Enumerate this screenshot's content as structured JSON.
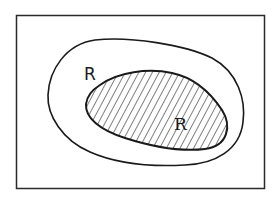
{
  "diagram": {
    "type": "venn-region",
    "frame": {
      "stroke": "#2a2a2a"
    },
    "outer_region": {
      "label": "R",
      "stroke": "#1a1a1a"
    },
    "inner_region": {
      "label": "R",
      "stroke": "#1a1a1a",
      "fill_pattern": "diagonal-hatch",
      "hatch_color": "#2a2a2a"
    }
  }
}
